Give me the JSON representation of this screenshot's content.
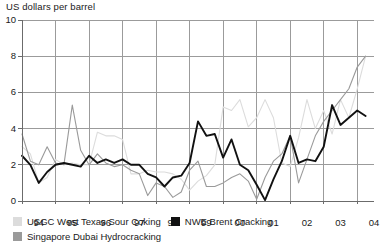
{
  "chart_data": {
    "type": "line",
    "title": "US dollars per barrel",
    "xlabel": "",
    "ylabel": "US dollars per barrel",
    "ylim": [
      0,
      10
    ],
    "yticks": [
      0,
      2,
      4,
      6,
      8,
      10
    ],
    "xlim": [
      1994,
      2004.5
    ],
    "xticks": [
      1994,
      1995,
      1996,
      1997,
      1998,
      1999,
      2000,
      2001,
      2002,
      2003,
      2004
    ],
    "xtick_labels": [
      "94",
      "95",
      "96",
      "97",
      "98",
      "99",
      "00",
      "01",
      "02",
      "03",
      "04"
    ],
    "grid": true,
    "legend_position": "bottom-left",
    "x": [
      1994.0,
      1994.25,
      1994.5,
      1994.75,
      1995.0,
      1995.25,
      1995.5,
      1995.75,
      1996.0,
      1996.25,
      1996.5,
      1996.75,
      1997.0,
      1997.25,
      1997.5,
      1997.75,
      1998.0,
      1998.25,
      1998.5,
      1998.75,
      1999.0,
      1999.25,
      1999.5,
      1999.75,
      2000.0,
      2000.25,
      2000.5,
      2000.75,
      2001.0,
      2001.25,
      2001.5,
      2001.75,
      2002.0,
      2002.25,
      2002.5,
      2002.75,
      2003.0,
      2003.25,
      2003.5,
      2003.75,
      2004.0,
      2004.25
    ],
    "series": [
      {
        "name": "USGC West Texas Sour Coking",
        "color": "#dcdcdc",
        "values": [
          3.0,
          2.6,
          1.0,
          1.3,
          2.3,
          2.0,
          2.1,
          2.0,
          2.0,
          3.8,
          3.6,
          3.6,
          3.4,
          1.5,
          1.5,
          1.7,
          1.6,
          1.6,
          1.5,
          1.2,
          0.6,
          1.1,
          1.4,
          2.0,
          5.2,
          5.0,
          5.6,
          4.1,
          4.6,
          5.6,
          4.6,
          2.1,
          1.9,
          3.5,
          5.6,
          4.0,
          5.0,
          3.7,
          5.6,
          4.6,
          6.2,
          8.0
        ]
      },
      {
        "name": "NWE Brent Cracking",
        "color": "#111111",
        "values": [
          2.5,
          2.0,
          1.0,
          1.6,
          2.0,
          2.1,
          2.0,
          1.9,
          2.5,
          2.1,
          2.3,
          2.1,
          2.3,
          2.0,
          2.0,
          1.5,
          1.3,
          0.8,
          1.3,
          1.4,
          2.1,
          4.4,
          3.6,
          3.7,
          2.4,
          3.4,
          2.0,
          1.7,
          0.9,
          0.05,
          1.2,
          2.2,
          3.6,
          2.1,
          2.3,
          2.2,
          3.0,
          5.3,
          4.2,
          4.6,
          5.0,
          4.7
        ]
      },
      {
        "name": "Singapore Dubai Hydrocracking",
        "color": "#9a9a9a",
        "values": [
          3.7,
          2.2,
          2.0,
          3.0,
          2.1,
          2.0,
          5.3,
          2.8,
          2.0,
          2.6,
          2.1,
          1.9,
          2.0,
          1.7,
          1.5,
          0.3,
          1.0,
          0.8,
          0.2,
          0.5,
          1.7,
          2.2,
          0.8,
          0.8,
          1.0,
          1.3,
          1.5,
          1.1,
          0.1,
          1.3,
          2.2,
          2.6,
          3.6,
          1.0,
          2.3,
          3.6,
          4.4,
          5.0,
          5.6,
          6.2,
          7.4,
          8.0
        ]
      }
    ]
  },
  "legend": {
    "items": [
      {
        "label": "USGC West Texas Sour Coking",
        "color": "#dcdcdc"
      },
      {
        "label": "NWE Brent Cracking",
        "color": "#111111"
      },
      {
        "label": "Singapore Dubai Hydrocracking",
        "color": "#9a9a9a"
      }
    ]
  }
}
